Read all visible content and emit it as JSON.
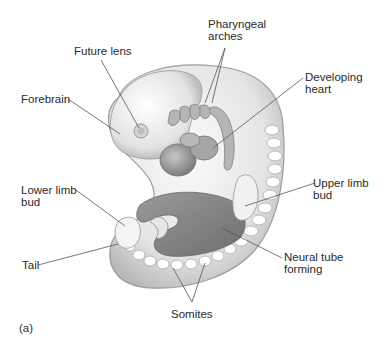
{
  "figure": {
    "panel_label": "(a)",
    "labels": {
      "future_lens": "Future lens",
      "forebrain": "Forebrain",
      "pharyngeal_arches_line1": "Pharyngeal",
      "pharyngeal_arches_line2": "arches",
      "developing_heart_line1": "Developing",
      "developing_heart_line2": "heart",
      "lower_limb_bud_line1": "Lower limb",
      "lower_limb_bud_line2": "bud",
      "upper_limb_bud_line1": "Upper limb",
      "upper_limb_bud_line2": "bud",
      "tail": "Tail",
      "neural_tube_line1": "Neural tube",
      "neural_tube_line2": "forming",
      "somites": "Somites"
    },
    "colors": {
      "background": "#ffffff",
      "text": "#2a2a2a",
      "leader_line": "#555555",
      "embryo_light": "#f2f2f2",
      "embryo_mid": "#cfcfcf",
      "embryo_dark": "#8a8a8a"
    }
  }
}
